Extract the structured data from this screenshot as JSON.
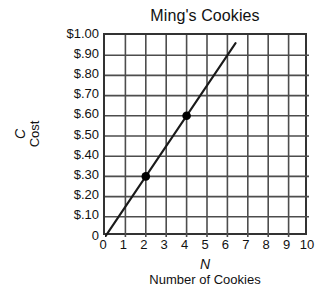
{
  "chart_data": {
    "type": "line",
    "title": "Ming's Cookies",
    "xlabel": "Number of Cookies",
    "xlabel_symbol": "N",
    "ylabel": "Cost",
    "ylabel_symbol": "C",
    "xlim": [
      0,
      10
    ],
    "ylim": [
      0,
      1.0
    ],
    "grid": true,
    "legend": "none",
    "x_ticks": [
      0,
      1,
      2,
      3,
      4,
      5,
      6,
      7,
      8,
      9,
      10
    ],
    "x_tick_labels": [
      "0",
      "1",
      "2",
      "3",
      "4",
      "5",
      "6",
      "7",
      "8",
      "9",
      "10"
    ],
    "y_ticks": [
      1.0,
      0.9,
      0.8,
      0.7,
      0.6,
      0.5,
      0.4,
      0.3,
      0.2,
      0.1,
      0
    ],
    "y_tick_labels": [
      "$1.00",
      "$.90",
      "$.80",
      "$.70",
      "$.60",
      "$.50",
      "$.40",
      "$.30",
      "$.20",
      "$.10",
      "0"
    ],
    "series": [
      {
        "name": "Cost of cookies",
        "slope": 0.15,
        "intercept": 0,
        "line_x": [
          0,
          6.4
        ],
        "line_y": [
          0,
          0.96
        ],
        "marked_points": [
          {
            "x": 2,
            "y": 0.3,
            "label": "(2, $.30)"
          },
          {
            "x": 4,
            "y": 0.6,
            "label": "(4, $.60)"
          }
        ]
      }
    ],
    "colors": {
      "line": "#1a1a1a",
      "grid": "#4d4d4d",
      "axis": "#333333",
      "marker": "#000000",
      "background": "#ffffff",
      "text": "#111111"
    }
  }
}
